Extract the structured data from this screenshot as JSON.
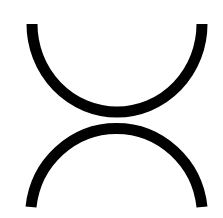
{
  "symbol": {
    "name": "two-tangent-semicircles",
    "description": "Two semicircular arcs, one opening upward and one opening downward, touching at the center",
    "stroke_color": "#000000",
    "background_color": "#ffffff",
    "stroke_width": 11
  }
}
